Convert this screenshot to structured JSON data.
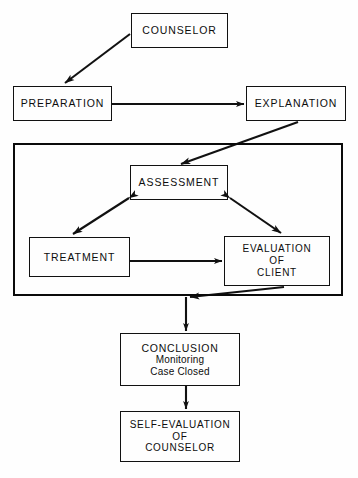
{
  "diagram": {
    "canvas": {
      "width": 358,
      "height": 478
    },
    "stroke_color": "#111111",
    "background_color": "#ffffff",
    "nodes": {
      "counselor": {
        "label": "COUNSELOR",
        "x": 131,
        "y": 13,
        "w": 97,
        "h": 35
      },
      "preparation": {
        "label": "PREPARATION",
        "x": 13,
        "y": 86,
        "w": 99,
        "h": 35
      },
      "explanation": {
        "label": "EXPLANATION",
        "x": 246,
        "y": 86,
        "w": 100,
        "h": 35
      },
      "assessment": {
        "label": "ASSESSMENT",
        "x": 130,
        "y": 165,
        "w": 98,
        "h": 35
      },
      "treatment": {
        "label": "TREATMENT",
        "x": 29,
        "y": 237,
        "w": 101,
        "h": 40
      },
      "evaluation_of_client": {
        "line1": "EVALUATION",
        "line2": "OF",
        "line3": "CLIENT",
        "x": 224,
        "y": 236,
        "w": 106,
        "h": 50
      },
      "conclusion": {
        "line1": "CONCLUSION",
        "line2": "Monitoring",
        "line3": "Case Closed",
        "x": 120,
        "y": 333,
        "w": 120,
        "h": 53
      },
      "self_evaluation": {
        "line1": "SELF-EVALUATION",
        "line2": "OF",
        "line3": "COUNSELOR",
        "x": 120,
        "y": 411,
        "w": 120,
        "h": 51
      }
    },
    "group_frame": {
      "name": "counseling-cycle-frame",
      "x": 13,
      "y": 143,
      "w": 330,
      "h": 153
    },
    "edges": [
      {
        "name": "counselor-to-preparation",
        "from": "counselor",
        "to": "preparation",
        "style": "single-arrow",
        "direction": "diagonal-down-left"
      },
      {
        "name": "preparation-to-explanation",
        "from": "preparation",
        "to": "explanation",
        "style": "single-arrow",
        "direction": "horizontal-right"
      },
      {
        "name": "explanation-to-assessment",
        "from": "explanation",
        "to": "assessment",
        "style": "single-arrow",
        "direction": "diagonal-down-left"
      },
      {
        "name": "assessment-treatment",
        "from": "assessment",
        "to": "treatment",
        "style": "double-arrow",
        "direction": "diagonal"
      },
      {
        "name": "assessment-evaluation",
        "from": "assessment",
        "to": "evaluation_of_client",
        "style": "double-arrow",
        "direction": "diagonal"
      },
      {
        "name": "treatment-to-evaluation",
        "from": "treatment",
        "to": "evaluation_of_client",
        "style": "single-arrow",
        "direction": "horizontal-right"
      },
      {
        "name": "evaluation-to-conclusion",
        "from": "evaluation_of_client",
        "to": "conclusion",
        "style": "single-arrow",
        "direction": "diagonal-then-down"
      },
      {
        "name": "conclusion-to-self-evaluation",
        "from": "conclusion",
        "to": "self_evaluation",
        "style": "single-arrow",
        "direction": "vertical-down"
      }
    ]
  }
}
